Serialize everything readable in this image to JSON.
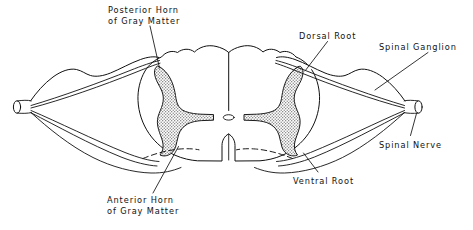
{
  "figure": {
    "background_color": "#ffffff",
    "line_color": "#111111",
    "gray_matter_fill": "#b9b9b9",
    "labels": [
      {
        "id": "posterior-horn",
        "line1": "Posterior Horn",
        "line2": "of Gray Matter"
      },
      {
        "id": "dorsal-root",
        "line1": "Dorsal Root",
        "line2": ""
      },
      {
        "id": "spinal-ganglion",
        "line1": "Spinal Ganglion",
        "line2": ""
      },
      {
        "id": "spinal-nerve",
        "line1": "Spinal Nerve",
        "line2": ""
      },
      {
        "id": "ventral-root",
        "line1": "Ventral Root",
        "line2": ""
      },
      {
        "id": "anterior-horn",
        "line1": "Anterior Horn",
        "line2": "of Gray Matter"
      }
    ],
    "structures": [
      "spinal-cord-outline",
      "gray-matter-left",
      "gray-matter-right",
      "central-canal",
      "dorsal-median-sulcus",
      "ventral-median-fissure",
      "dorsal-root-left",
      "dorsal-root-right",
      "ventral-root-left",
      "ventral-root-right",
      "spinal-ganglion-left",
      "spinal-ganglion-right",
      "spinal-nerve-left",
      "spinal-nerve-right"
    ]
  }
}
